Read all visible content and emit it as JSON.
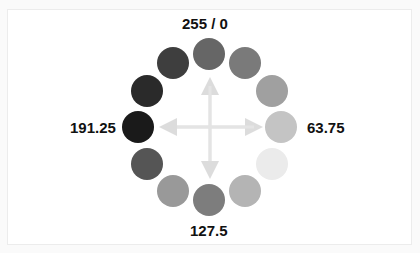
{
  "diagram": {
    "type": "gray-value-circle",
    "labels": {
      "top": "255 / 0",
      "right": "63.75",
      "bottom": "127.5",
      "left": "191.25"
    },
    "circles": [
      {
        "position": "top",
        "cx": 209,
        "cy": 54,
        "color": "#666666"
      },
      {
        "position": "top-right",
        "cx": 245,
        "cy": 63,
        "color": "#7a7a7a"
      },
      {
        "position": "right-upper",
        "cx": 272,
        "cy": 91,
        "color": "#a0a0a0"
      },
      {
        "position": "right",
        "cx": 281,
        "cy": 127,
        "color": "#c4c4c4"
      },
      {
        "position": "right-lower",
        "cx": 272,
        "cy": 164,
        "color": "#ebebeb"
      },
      {
        "position": "bottom-right",
        "cx": 245,
        "cy": 191,
        "color": "#b4b4b4"
      },
      {
        "position": "bottom",
        "cx": 209,
        "cy": 200,
        "color": "#7d7d7d"
      },
      {
        "position": "bottom-left",
        "cx": 173,
        "cy": 191,
        "color": "#999999"
      },
      {
        "position": "left-lower",
        "cx": 147,
        "cy": 164,
        "color": "#555555"
      },
      {
        "position": "left",
        "cx": 138,
        "cy": 127,
        "color": "#1a1a1a"
      },
      {
        "position": "left-upper",
        "cx": 147,
        "cy": 91,
        "color": "#2a2a2a"
      },
      {
        "position": "top-left",
        "cx": 173,
        "cy": 63,
        "color": "#3e3e3e"
      }
    ],
    "arrow_color": "#e2e2e2"
  }
}
